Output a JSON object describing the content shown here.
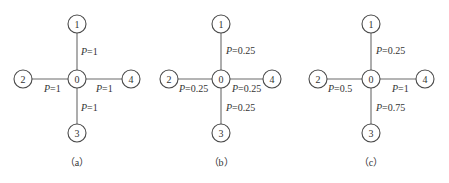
{
  "figure": {
    "panels": [
      {
        "id": "a",
        "caption": "（a）",
        "center": {
          "x": 77,
          "y": 79
        },
        "nodes": [
          {
            "label": "0",
            "x": 77,
            "y": 79
          },
          {
            "label": "1",
            "x": 77,
            "y": 24
          },
          {
            "label": "2",
            "x": 23,
            "y": 79
          },
          {
            "label": "3",
            "x": 77,
            "y": 133
          },
          {
            "label": "4",
            "x": 131,
            "y": 79
          }
        ],
        "edges": [
          {
            "to": "1",
            "p_var": "P",
            "p_value": "=1"
          },
          {
            "to": "2",
            "p_var": "P",
            "p_value": "=1"
          },
          {
            "to": "3",
            "p_var": "P",
            "p_value": "=1"
          },
          {
            "to": "4",
            "p_var": "P",
            "p_value": "=1"
          }
        ]
      },
      {
        "id": "b",
        "caption": "（b）",
        "center": {
          "x": 221,
          "y": 79
        },
        "nodes": [
          {
            "label": "0",
            "x": 221,
            "y": 79
          },
          {
            "label": "1",
            "x": 221,
            "y": 24
          },
          {
            "label": "2",
            "x": 169,
            "y": 79
          },
          {
            "label": "3",
            "x": 221,
            "y": 133
          },
          {
            "label": "4",
            "x": 272,
            "y": 79
          }
        ],
        "edges": [
          {
            "to": "1",
            "p_var": "P",
            "p_value": "=0.25"
          },
          {
            "to": "2",
            "p_var": "P",
            "p_value": "=0.25"
          },
          {
            "to": "3",
            "p_var": "P",
            "p_value": "=0.25"
          },
          {
            "to": "4",
            "p_var": "P",
            "p_value": "=0.25"
          }
        ]
      },
      {
        "id": "c",
        "caption": "（c）",
        "center": {
          "x": 371,
          "y": 79
        },
        "nodes": [
          {
            "label": "0",
            "x": 371,
            "y": 79
          },
          {
            "label": "1",
            "x": 371,
            "y": 24
          },
          {
            "label": "2",
            "x": 318,
            "y": 79
          },
          {
            "label": "3",
            "x": 371,
            "y": 133
          },
          {
            "label": "4",
            "x": 425,
            "y": 79
          }
        ],
        "edges": [
          {
            "to": "1",
            "p_var": "P",
            "p_value": "=0.25"
          },
          {
            "to": "2",
            "p_var": "P",
            "p_value": "=0.5"
          },
          {
            "to": "3",
            "p_var": "P",
            "p_value": "=0.75"
          },
          {
            "to": "4",
            "p_var": "P",
            "p_value": "=1"
          }
        ]
      }
    ]
  }
}
